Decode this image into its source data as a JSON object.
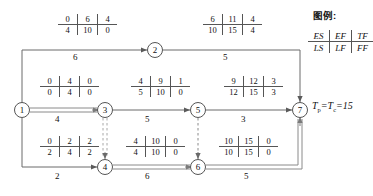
{
  "legend": {
    "title": "图例:",
    "row_top": [
      "ES",
      "EF",
      "TF"
    ],
    "row_bottom": [
      "LS",
      "LF",
      "FF"
    ]
  },
  "annotation": {
    "formula_prefix": "T",
    "formula_sub1": "p",
    "formula_mid": "=T",
    "formula_sub2": "c",
    "formula_suffix": "=15",
    "formula_text": "Tp=Tc=15"
  },
  "nodes": [
    {
      "id": "1",
      "label": "1",
      "x": 22,
      "y": 110
    },
    {
      "id": "2",
      "label": "2",
      "x": 155,
      "y": 50
    },
    {
      "id": "3",
      "label": "3",
      "x": 105,
      "y": 110
    },
    {
      "id": "4",
      "label": "4",
      "x": 105,
      "y": 167
    },
    {
      "id": "5",
      "label": "5",
      "x": 198,
      "y": 110
    },
    {
      "id": "6",
      "label": "6",
      "x": 198,
      "y": 167
    },
    {
      "id": "7",
      "label": "7",
      "x": 300,
      "y": 110
    }
  ],
  "arcs": [
    {
      "name": "arc-1-2",
      "from": "1",
      "to": "2",
      "duration": "6",
      "label_x": 78,
      "label_y": 55,
      "style": "solid"
    },
    {
      "name": "arc-2-7",
      "from": "2",
      "to": "7",
      "duration": "5",
      "label_x": 228,
      "label_y": 55,
      "style": "solid"
    },
    {
      "name": "arc-1-3",
      "from": "1",
      "to": "3",
      "duration": "4",
      "label_x": 60,
      "label_y": 117,
      "style": "critical"
    },
    {
      "name": "arc-3-5",
      "from": "3",
      "to": "5",
      "duration": "5",
      "label_x": 150,
      "label_y": 117,
      "style": "solid"
    },
    {
      "name": "arc-5-7",
      "from": "5",
      "to": "7",
      "duration": "3",
      "label_x": 245,
      "label_y": 117,
      "style": "solid"
    },
    {
      "name": "arc-1-4",
      "from": "1",
      "to": "4",
      "duration": "2",
      "label_x": 60,
      "label_y": 174,
      "style": "solid"
    },
    {
      "name": "arc-4-6",
      "from": "4",
      "to": "6",
      "duration": "6",
      "label_x": 150,
      "label_y": 174,
      "style": "critical"
    },
    {
      "name": "arc-6-7",
      "from": "6",
      "to": "7",
      "duration": "5",
      "label_x": 248,
      "label_y": 174,
      "style": "critical"
    },
    {
      "name": "arc-3-4-dummy",
      "from": "3",
      "to": "4",
      "duration": "",
      "label_x": 0,
      "label_y": 0,
      "style": "dashed-critical"
    },
    {
      "name": "arc-5-6-dummy",
      "from": "5",
      "to": "6",
      "duration": "",
      "label_x": 0,
      "label_y": 0,
      "style": "dashed"
    }
  ],
  "time_boxes": [
    {
      "name": "timebox-arc-1-2",
      "x": 58,
      "y": 14,
      "top": [
        "0",
        "6",
        "4"
      ],
      "bottom": [
        "4",
        "10",
        "0"
      ]
    },
    {
      "name": "timebox-arc-2-7",
      "x": 203,
      "y": 14,
      "top": [
        "6",
        "11",
        "4"
      ],
      "bottom": [
        "10",
        "15",
        "4"
      ]
    },
    {
      "name": "timebox-arc-1-3",
      "x": 40,
      "y": 76,
      "top": [
        "0",
        "4",
        "0"
      ],
      "bottom": [
        "0",
        "4",
        "0"
      ]
    },
    {
      "name": "timebox-arc-3-5",
      "x": 131,
      "y": 76,
      "top": [
        "4",
        "9",
        "1"
      ],
      "bottom": [
        "5",
        "10",
        "0"
      ]
    },
    {
      "name": "timebox-arc-5-7",
      "x": 224,
      "y": 76,
      "top": [
        "9",
        "12",
        "3"
      ],
      "bottom": [
        "12",
        "15",
        "3"
      ]
    },
    {
      "name": "timebox-arc-1-4",
      "x": 40,
      "y": 136,
      "top": [
        "0",
        "2",
        "2"
      ],
      "bottom": [
        "2",
        "4",
        "2"
      ]
    },
    {
      "name": "timebox-arc-4-6",
      "x": 126,
      "y": 136,
      "top": [
        "4",
        "10",
        "0"
      ],
      "bottom": [
        "4",
        "10",
        "0"
      ]
    },
    {
      "name": "timebox-arc-6-7",
      "x": 219,
      "y": 136,
      "top": [
        "10",
        "15",
        "0"
      ],
      "bottom": [
        "10",
        "15",
        "0"
      ]
    }
  ]
}
